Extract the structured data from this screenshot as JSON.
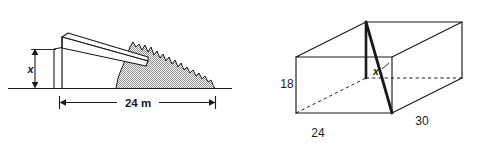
{
  "figure": {
    "background_color": "#ffffff",
    "line_color": "#1a1a1a",
    "fill_gray": "#9a9a9a"
  },
  "left_figure": {
    "name": "conveyor-stockpile-diagram",
    "description": "Side view of a conveyor discharging onto a jagged stockpile on the ground",
    "labels": {
      "height": "x",
      "base_length": "24 m"
    },
    "dimensions": {
      "height_label": "x",
      "base_label": "24 m",
      "base_value": 24,
      "base_unit": "m"
    },
    "elements": {
      "ground_line": "ground-line",
      "conveyor": "conveyor-ramp",
      "support_post": "vertical-support-post",
      "pile": "hatched-material-pile",
      "height_arrow": "height-dimension-arrow",
      "base_arrow": "base-dimension-arrow"
    }
  },
  "right_figure": {
    "name": "rectangular-box-diagram",
    "description": "Rectangular prism drawn in oblique projection with a bold space diagonal",
    "labels": {
      "height": "18",
      "width": "24",
      "length": "30",
      "diagonal": "x"
    },
    "dimensions": {
      "height": 18,
      "width": 24,
      "length": 30,
      "diagonal_label": "x"
    },
    "elements": {
      "solid_edges": "box-solid-edges",
      "hidden_edges": "box-hidden-dashed-edges",
      "diagonal": "box-space-diagonal"
    }
  }
}
